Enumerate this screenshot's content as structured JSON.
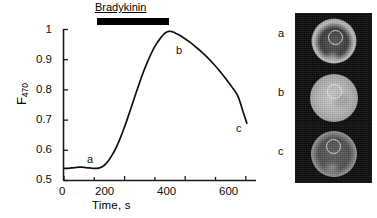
{
  "figure": {
    "stimulus_label": "Bradykinin"
  },
  "axes": {
    "x_title": "Time, s",
    "y_title_base": "F",
    "y_title_sub": "470",
    "x_ticks": [
      "0",
      "200",
      "400",
      "600"
    ],
    "y_ticks": [
      "1",
      "0.9",
      "0.8",
      "0.7",
      "0.6",
      "0.5"
    ]
  },
  "point_labels": {
    "a": "a",
    "b": "b",
    "c": "c"
  },
  "panel": {
    "row_labels": [
      "a",
      "b",
      "c"
    ]
  },
  "chart_data": {
    "type": "line",
    "title": "",
    "xlabel": "Time, s",
    "ylabel": "F470",
    "xlim": [
      0,
      640
    ],
    "ylim": [
      0.5,
      1.0
    ],
    "xtick_values": [
      0,
      200,
      400,
      600
    ],
    "xminor_tick_values": [
      100,
      300,
      500
    ],
    "ytick_values": [
      0.5,
      0.6,
      0.7,
      0.8,
      0.9,
      1.0
    ],
    "grid": false,
    "legend": null,
    "series": [
      {
        "name": "F470",
        "x": [
          0,
          10,
          20,
          30,
          40,
          50,
          60,
          70,
          80,
          90,
          100,
          110,
          120,
          130,
          140,
          150,
          160,
          170,
          180,
          190,
          200,
          210,
          220,
          230,
          240,
          250,
          260,
          270,
          280,
          290,
          300,
          310,
          320,
          330,
          340,
          350,
          360,
          370,
          380,
          400,
          420,
          440,
          460,
          480,
          500,
          520,
          540,
          560,
          580,
          600,
          610
        ],
        "y": [
          0.54,
          0.54,
          0.541,
          0.542,
          0.543,
          0.544,
          0.544,
          0.543,
          0.542,
          0.541,
          0.54,
          0.54,
          0.542,
          0.547,
          0.556,
          0.568,
          0.583,
          0.601,
          0.622,
          0.646,
          0.672,
          0.7,
          0.729,
          0.759,
          0.789,
          0.818,
          0.846,
          0.872,
          0.896,
          0.918,
          0.938,
          0.955,
          0.969,
          0.981,
          0.99,
          0.994,
          0.993,
          0.989,
          0.984,
          0.972,
          0.958,
          0.942,
          0.925,
          0.906,
          0.885,
          0.862,
          0.837,
          0.81,
          0.78,
          0.72,
          0.69
        ]
      }
    ],
    "annotations": [
      {
        "text": "Bradykinin",
        "type": "stimulus_bar",
        "x_start": 110,
        "x_end": 350,
        "y": 1.04
      },
      {
        "text": "a",
        "x": 60,
        "y": 0.575
      },
      {
        "text": "b",
        "x": 370,
        "y": 0.955
      },
      {
        "text": "c",
        "x": 612,
        "y": 0.7
      }
    ]
  }
}
